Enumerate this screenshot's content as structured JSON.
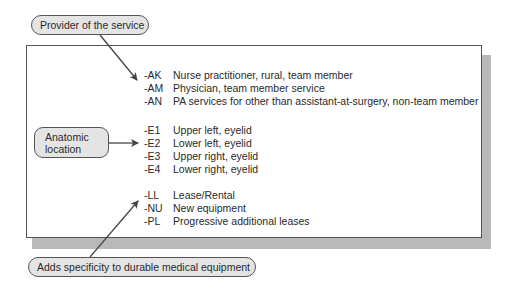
{
  "callouts": {
    "provider": "Provider of the service",
    "anatomic_line1": "Anatomic",
    "anatomic_line2": "location",
    "dme": "Adds specificity to durable medical equipment"
  },
  "groups": [
    {
      "name": "provider",
      "rows": [
        {
          "code": "-AK",
          "desc": "Nurse practitioner, rural, team member"
        },
        {
          "code": "-AM",
          "desc": "Physician, team member service"
        },
        {
          "code": "-AN",
          "desc": "PA services for other than assistant-at-surgery, non-team member"
        }
      ]
    },
    {
      "name": "anatomic",
      "rows": [
        {
          "code": "-E1",
          "desc": "Upper left, eyelid"
        },
        {
          "code": "-E2",
          "desc": "Lower left, eyelid"
        },
        {
          "code": "-E3",
          "desc": "Upper right, eyelid"
        },
        {
          "code": "-E4",
          "desc": "Lower right, eyelid"
        }
      ]
    },
    {
      "name": "dme",
      "rows": [
        {
          "code": "-LL",
          "desc": "Lease/Rental"
        },
        {
          "code": "-NU",
          "desc": "New equipment"
        },
        {
          "code": "-PL",
          "desc": "Progressive additional leases"
        }
      ]
    }
  ],
  "colors": {
    "pill_fill": "#e4e4e4",
    "border": "#555555",
    "shadow": "#b9b9b9",
    "arrow": "#444444"
  }
}
